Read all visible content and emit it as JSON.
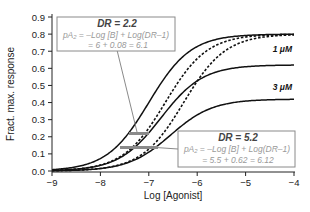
{
  "chart_data": {
    "type": "line",
    "title": "",
    "xlabel": "Log [Agonist]",
    "ylabel": "Fract. max. response",
    "xlim": [
      -9,
      -4
    ],
    "ylim": [
      0,
      0.9
    ],
    "x_ticks": [
      "-9",
      "-8",
      "-7",
      "-6",
      "-5",
      "-4"
    ],
    "y_ticks": [
      "0.0",
      "0.1",
      "0.2",
      "0.3",
      "0.4",
      "0.5",
      "0.6",
      "0.7",
      "0.8",
      "0.9"
    ],
    "grid": false,
    "legend": "none",
    "series": [
      {
        "name": "Control",
        "style": "solid",
        "emax": 0.8,
        "logEC50": -7.0,
        "hill": 1.0
      },
      {
        "name": "1 μM antagonist (refit, DR=2.2)",
        "style": "dashed",
        "emax": 0.8,
        "logEC50": -6.66,
        "hill": 1.0
      },
      {
        "name": "3 μM antagonist (refit, DR=5.2)",
        "style": "dashed",
        "emax": 0.8,
        "logEC50": -6.28,
        "hill": 1.0
      },
      {
        "name": "1 μM",
        "style": "solid",
        "emax": 0.62,
        "logEC50": -6.75,
        "hill": 1.0
      },
      {
        "name": "3 μM",
        "style": "solid",
        "emax": 0.42,
        "logEC50": -6.55,
        "hill": 1.0
      }
    ],
    "curve_labels": [
      {
        "text": "1 μM",
        "x": -4.3,
        "y": 0.7
      },
      {
        "text": "3 μM",
        "x": -4.3,
        "y": 0.5
      }
    ],
    "markers": [
      {
        "name": "DR 2.2 level",
        "y": 0.22,
        "x_from": -7.5,
        "x_to": -7.1
      },
      {
        "name": "DR 5.2 level",
        "y": 0.14,
        "x_from": -7.7,
        "x_to": -6.95
      }
    ],
    "annotations": [
      {
        "title": "DR = 2.2",
        "equation": "pA₂ = –Log [B] + Log(DR–1)",
        "result": "= 6 + 0.08 = 6.1"
      },
      {
        "title": "DR = 5.2",
        "equation": "pA₂ = –Log [B] + Log(DR–1)",
        "result": "= 5.5 + 0.62 = 6.12"
      }
    ]
  }
}
